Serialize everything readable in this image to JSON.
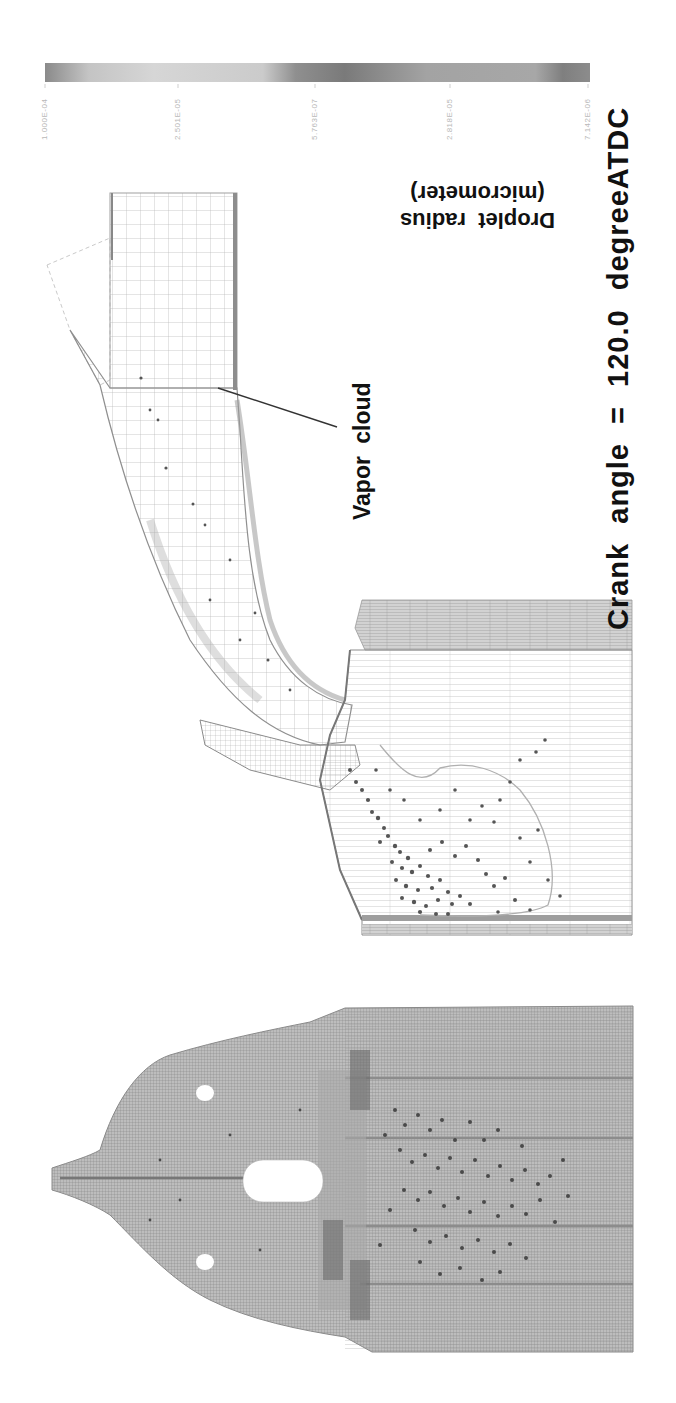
{
  "figure": {
    "caption": "Crank angle = 120.0 degreeATDC",
    "colorbar": {
      "title_line1": "Droplet radius",
      "title_line2": "(micrometer)",
      "tick_labels": [
        "1.000E-04",
        "2.501E-05",
        "5.763E-07",
        "2.818E-05",
        "7.142E-06"
      ],
      "colors": [
        "#8a8a8a",
        "#cfcfcf",
        "#c9c9c9",
        "#7a7a7a",
        "#9a9a9a",
        "#a0a0a0",
        "#7c7c7c"
      ]
    },
    "annotations": [
      {
        "label": "Vapor cloud"
      }
    ],
    "panels": [
      {
        "name": "Intake port and cylinder side view (spray)"
      },
      {
        "name": "Cylinder head top view (spray)"
      }
    ]
  }
}
